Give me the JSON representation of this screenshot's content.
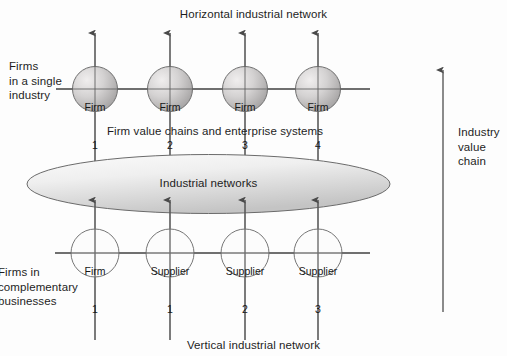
{
  "diagram": {
    "title_top": "Horizontal industrial network",
    "title_bottom": "Vertical industrial network",
    "middle_label": "Firm value chains and enterprise systems",
    "ellipse_label": "Industrial networks",
    "left_label_top": "Firms\nin a single\nindustry",
    "left_label_bottom": "Firms in\ncomplementary\nbusinesses",
    "right_label": "Industry\nvalue\nchain",
    "colors": {
      "background": "#fdfdfd",
      "text": "#1d1d1d",
      "line": "#555555",
      "arrow": "#4a4a4a",
      "top_node_fill_light": "#eceaea",
      "top_node_fill_dark": "#a9a9a9",
      "top_node_stroke": "#6f6f6f",
      "bottom_node_fill": "#fafafa",
      "bottom_node_stroke": "#767676",
      "ellipse_fill_light": "#f6f6f6",
      "ellipse_fill_dark": "#c8c8c8",
      "ellipse_stroke": "#6b6b6b"
    },
    "top_row": {
      "group_label": "Firms in a single industry",
      "nodes": [
        {
          "name": "Firm",
          "number": "1"
        },
        {
          "name": "Firm",
          "number": "2"
        },
        {
          "name": "Firm",
          "number": "3"
        },
        {
          "name": "Firm",
          "number": "4"
        }
      ]
    },
    "bottom_row": {
      "group_label": "Firms in complementary businesses",
      "nodes": [
        {
          "name": "Firm",
          "number": "1"
        },
        {
          "name": "Supplier",
          "number": "1"
        },
        {
          "name": "Supplier",
          "number": "2"
        },
        {
          "name": "Supplier",
          "number": "3"
        }
      ]
    }
  }
}
